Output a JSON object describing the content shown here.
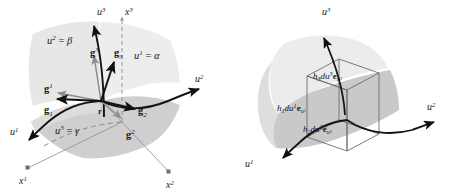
{
  "figure": {
    "background_color": "#ffffff",
    "ink_color": "#141414",
    "gray_color": "#8d8d8d",
    "surface_light": "#e6e6e6",
    "surface_mid": "#d8d8d8",
    "surface_dark": "#c9c9c9",
    "panels": [
      {
        "id": "left-panel",
        "name": "basis-vector-panel",
        "coordinate_surfaces": [
          {
            "name": "u2-surface-label",
            "text": "u2 = β",
            "base": "u",
            "sup": "2",
            "value": "β"
          },
          {
            "name": "u1-surface-label",
            "text": "u1 = α",
            "base": "u",
            "sup": "1",
            "value": "α"
          },
          {
            "name": "u3-surface-label",
            "text": "u3 = γ",
            "base": "u",
            "sup": "3",
            "value": "γ"
          }
        ],
        "curvilinear_axes": [
          {
            "name": "u1-axis-label",
            "base": "u",
            "sup": "1"
          },
          {
            "name": "u2-axis-label",
            "base": "u",
            "sup": "2"
          },
          {
            "name": "u3-axis-label",
            "base": "u",
            "sup": "3"
          }
        ],
        "cartesian_axes": [
          {
            "name": "x1-axis-label",
            "base": "x",
            "sup": "1"
          },
          {
            "name": "x2-axis-label",
            "base": "x",
            "sup": "2"
          },
          {
            "name": "x3-axis-label",
            "base": "x",
            "sup": "3"
          }
        ],
        "position_vector": {
          "name": "position-vector-label",
          "text": "r"
        },
        "covariant_vectors": [
          {
            "name": "g1-covariant-label",
            "base": "g",
            "sub": "1",
            "color": "#111111"
          },
          {
            "name": "g2-covariant-label",
            "base": "g",
            "sub": "2",
            "color": "#111111"
          },
          {
            "name": "g3-covariant-label",
            "base": "g",
            "sub": "3",
            "color": "#111111"
          }
        ],
        "contravariant_vectors": [
          {
            "name": "g1-contravariant-label",
            "base": "g",
            "sup": "1",
            "color": "#8d8d8d"
          },
          {
            "name": "g2-contravariant-label",
            "base": "g",
            "sup": "2",
            "color": "#8d8d8d"
          },
          {
            "name": "g3-contravariant-label",
            "base": "g",
            "sup": "3",
            "color": "#8d8d8d"
          }
        ]
      },
      {
        "id": "right-panel",
        "name": "volume-element-panel",
        "curvilinear_axes": [
          {
            "name": "u1-axis-label",
            "base": "u",
            "sup": "1"
          },
          {
            "name": "u2-axis-label",
            "base": "u",
            "sup": "2"
          },
          {
            "name": "u3-axis-label",
            "base": "u",
            "sup": "3"
          }
        ],
        "edge_labels": [
          {
            "name": "h1-edge-label",
            "scale": "h",
            "scale_sub": "1",
            "differential": "du",
            "diff_sup": "1",
            "unit": "e",
            "unit_sub": "u1",
            "text": "h1du1 eu1"
          },
          {
            "name": "h2-edge-label",
            "scale": "h",
            "scale_sub": "2",
            "differential": "du",
            "diff_sup": "2",
            "unit": "e",
            "unit_sub": "u2",
            "text": "h2du2 eu2"
          },
          {
            "name": "h3-edge-label",
            "scale": "h",
            "scale_sub": "3",
            "differential": "du",
            "diff_sup": "3",
            "unit": "e",
            "unit_sub": "u3",
            "text": "h3du3 eu3"
          }
        ]
      }
    ]
  }
}
